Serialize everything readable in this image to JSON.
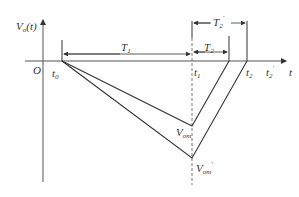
{
  "diagram": {
    "y_axis_label": "V",
    "y_axis_sub": "o",
    "y_axis_arg": "(t)",
    "x_axis_label": "t",
    "origin_label": "O",
    "time_labels": [
      {
        "main": "t",
        "sub": "0"
      },
      {
        "main": "t",
        "sub": "1"
      },
      {
        "main": "t",
        "sub": "2"
      },
      {
        "main": "t",
        "sub": "2",
        "prime": "′"
      }
    ],
    "intervals": [
      {
        "main": "T",
        "sub": "1"
      },
      {
        "main": "T",
        "sub": "2"
      },
      {
        "main": "T",
        "sub": "2",
        "prime": "′"
      }
    ],
    "voltage_labels": [
      {
        "main": "V",
        "sub": "om"
      },
      {
        "main": "V",
        "sub": "om",
        "prime": "′"
      }
    ]
  }
}
